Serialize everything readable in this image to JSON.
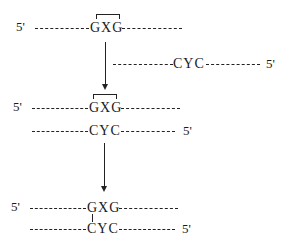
{
  "diagram": {
    "stage1": {
      "top_strand": {
        "five_prime": "5'",
        "motif": "GXG",
        "bracketed": true
      },
      "bottom_strand": {
        "motif": "CYC",
        "five_prime": "5'"
      }
    },
    "stage2": {
      "top_strand": {
        "five_prime": "5'",
        "motif": "GXG",
        "bracketed": true
      },
      "bottom_strand": {
        "motif": "CYC",
        "five_prime": "5'"
      }
    },
    "stage3": {
      "top_strand": {
        "five_prime": "5'",
        "motif": "GXG"
      },
      "bottom_strand": {
        "motif": "CYC",
        "five_prime": "5'"
      },
      "crosslink": "G-C link"
    },
    "arrows": [
      "stage1-to-stage2",
      "stage2-to-stage3"
    ],
    "colors": {
      "ink": "#222222",
      "background": "#ffffff"
    }
  }
}
